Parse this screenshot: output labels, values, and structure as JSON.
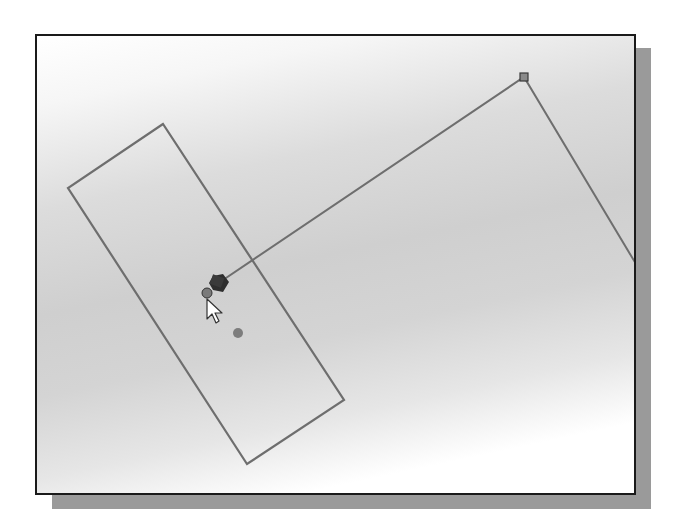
{
  "canvas": {
    "background_gradient": [
      "#ffffff",
      "#dcdcdc",
      "#cfcfcf",
      "#ffffff"
    ],
    "line_color": "#6e6e6e",
    "border_color": "#1a1a1a",
    "shadow_color": "#9a9a9a"
  },
  "sketch": {
    "rectangle": {
      "points": "126,88 31,152 210,428 307,364"
    },
    "polyline": {
      "points": "183,246 487,41 599,228"
    },
    "endpoint_square": {
      "x": 487,
      "y": 41,
      "size": 8
    },
    "snap_point_circle": {
      "cx": 170,
      "cy": 257,
      "r": 5
    },
    "center_point": {
      "cx": 201,
      "cy": 297,
      "r": 5
    },
    "active_marker": {
      "x": 183,
      "y": 246
    },
    "cursor": {
      "x": 170,
      "y": 262
    }
  },
  "icons": {
    "cursor": "arrow-cursor-icon",
    "endpoint": "square-endpoint-icon",
    "snap": "circle-snap-icon",
    "constraint": "diamond-constraint-icon"
  }
}
